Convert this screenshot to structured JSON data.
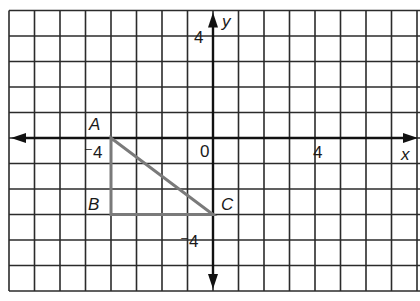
{
  "diagram": {
    "type": "coordinate-grid",
    "grid": {
      "origin_px": [
        213,
        138
      ],
      "unit_px": 25.5,
      "x_range": [
        -8,
        8
      ],
      "y_range": [
        -6,
        5
      ],
      "line_color": "#2b2b2b"
    },
    "axes": {
      "x_label": "x",
      "y_label": "y",
      "color": "#111111"
    },
    "tick_labels": [
      {
        "id": "x-neg4",
        "text": "⁻4",
        "x": -4
      },
      {
        "id": "origin",
        "text": "0",
        "x": 0
      },
      {
        "id": "x-pos4",
        "text": "4",
        "x": 4
      },
      {
        "id": "y-pos4",
        "text": "4",
        "y": 4
      },
      {
        "id": "y-neg4",
        "text": "⁻4",
        "y": -4
      }
    ],
    "triangle": {
      "color": "#7a7a7a",
      "vertices": [
        {
          "label": "A",
          "x": -4,
          "y": 0
        },
        {
          "label": "B",
          "x": -4,
          "y": -3
        },
        {
          "label": "C",
          "x": 0,
          "y": -3
        }
      ]
    }
  }
}
